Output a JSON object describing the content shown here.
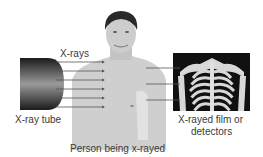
{
  "diagram": {
    "labels": {
      "xrays": "X-rays",
      "tube": "X-ray tube",
      "person": "Person being x-rayed",
      "film_line1": "X-rayed film or",
      "film_line2": "detectors"
    },
    "components": [
      {
        "id": "xray-tube",
        "label": "X-ray tube"
      },
      {
        "id": "person",
        "label": "Person being x-rayed"
      },
      {
        "id": "film",
        "label": "X-rayed film or detectors"
      }
    ],
    "ray_count": 6,
    "transmitted_ray_count": 3,
    "colors": {
      "text": "#3a3a3a",
      "ray": "#555555",
      "skin": "#d0d0d0",
      "film_bg": "#111111",
      "bone": "#d8d8d8"
    }
  }
}
